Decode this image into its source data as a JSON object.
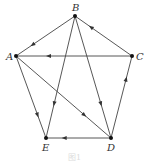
{
  "diagram": {
    "type": "directed-graph",
    "nodes": [
      {
        "id": "A",
        "label": "A",
        "x": 16,
        "y": 56,
        "lx": 6,
        "ly": 60
      },
      {
        "id": "B",
        "label": "B",
        "x": 75,
        "y": 16,
        "lx": 72,
        "ly": 11
      },
      {
        "id": "C",
        "label": "C",
        "x": 132,
        "y": 56,
        "lx": 136,
        "ly": 60
      },
      {
        "id": "D",
        "label": "D",
        "x": 111,
        "y": 138,
        "lx": 107,
        "ly": 151
      },
      {
        "id": "E",
        "label": "E",
        "x": 46,
        "y": 138,
        "lx": 42,
        "ly": 151
      }
    ],
    "edges": [
      {
        "from": "B",
        "to": "A"
      },
      {
        "from": "C",
        "to": "B"
      },
      {
        "from": "C",
        "to": "A"
      },
      {
        "from": "B",
        "to": "E"
      },
      {
        "from": "B",
        "to": "D"
      },
      {
        "from": "A",
        "to": "E"
      },
      {
        "from": "A",
        "to": "D"
      },
      {
        "from": "D",
        "to": "C"
      },
      {
        "from": "D",
        "to": "E"
      }
    ],
    "caption": "图1"
  }
}
